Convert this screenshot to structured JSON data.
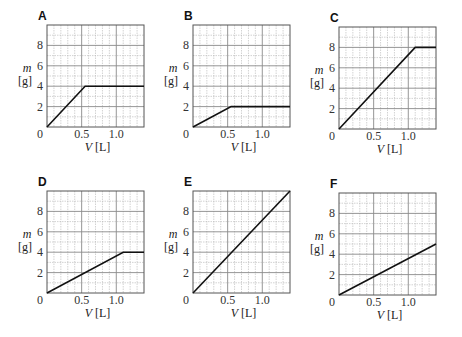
{
  "chart_data": [
    {
      "type": "line",
      "panel": "A",
      "xlabel_var": "V",
      "xlabel_unit": "[L]",
      "ylabel_var": "m",
      "ylabel_unit": "[g]",
      "xlim": [
        0,
        1.4
      ],
      "ylim": [
        0,
        10
      ],
      "xticks": [
        0.5,
        1.0
      ],
      "xtick_labels": [
        "0.5",
        "1.0"
      ],
      "yticks": [
        2,
        4,
        6,
        8
      ],
      "ytick_labels": [
        "2",
        "4",
        "6",
        "8"
      ],
      "origin_label": "0",
      "grid": true,
      "series": [
        {
          "name": "m vs V",
          "x": [
            0,
            0.55,
            1.4
          ],
          "y": [
            0,
            4,
            4
          ]
        }
      ]
    },
    {
      "type": "line",
      "panel": "B",
      "xlabel_var": "V",
      "xlabel_unit": "[L]",
      "ylabel_var": "m",
      "ylabel_unit": "[g]",
      "xlim": [
        0,
        1.4
      ],
      "ylim": [
        0,
        10
      ],
      "xticks": [
        0.5,
        1.0
      ],
      "xtick_labels": [
        "0.5",
        "1.0"
      ],
      "yticks": [
        2,
        4,
        6,
        8
      ],
      "ytick_labels": [
        "2",
        "4",
        "6",
        "8"
      ],
      "origin_label": "0",
      "grid": true,
      "series": [
        {
          "name": "m vs V",
          "x": [
            0,
            0.55,
            1.4
          ],
          "y": [
            0,
            2,
            2
          ]
        }
      ]
    },
    {
      "type": "line",
      "panel": "C",
      "xlabel_var": "V",
      "xlabel_unit": "[L]",
      "ylabel_var": "m",
      "ylabel_unit": "[g]",
      "xlim": [
        0,
        1.4
      ],
      "ylim": [
        0,
        10
      ],
      "xticks": [
        0.5,
        1.0
      ],
      "xtick_labels": [
        "0.5",
        "1.0"
      ],
      "yticks": [
        2,
        4,
        6,
        8
      ],
      "ytick_labels": [
        "2",
        "4",
        "6",
        "8"
      ],
      "origin_label": "0",
      "grid": true,
      "series": [
        {
          "name": "m vs V",
          "x": [
            0,
            1.1,
            1.4
          ],
          "y": [
            0,
            8,
            8
          ]
        }
      ]
    },
    {
      "type": "line",
      "panel": "D",
      "xlabel_var": "V",
      "xlabel_unit": "[L]",
      "ylabel_var": "m",
      "ylabel_unit": "[g]",
      "xlim": [
        0,
        1.4
      ],
      "ylim": [
        0,
        10
      ],
      "xticks": [
        0.5,
        1.0
      ],
      "xtick_labels": [
        "0.5",
        "1.0"
      ],
      "yticks": [
        2,
        4,
        6,
        8
      ],
      "ytick_labels": [
        "2",
        "4",
        "6",
        "8"
      ],
      "origin_label": "0",
      "grid": true,
      "series": [
        {
          "name": "m vs V",
          "x": [
            0,
            1.1,
            1.4
          ],
          "y": [
            0,
            4,
            4
          ]
        }
      ]
    },
    {
      "type": "line",
      "panel": "E",
      "xlabel_var": "V",
      "xlabel_unit": "[L]",
      "ylabel_var": "m",
      "ylabel_unit": "[g]",
      "xlim": [
        0,
        1.4
      ],
      "ylim": [
        0,
        10
      ],
      "xticks": [
        0.5,
        1.0
      ],
      "xtick_labels": [
        "0.5",
        "1.0"
      ],
      "yticks": [
        2,
        4,
        6,
        8
      ],
      "ytick_labels": [
        "2",
        "4",
        "6",
        "8"
      ],
      "origin_label": "0",
      "grid": true,
      "series": [
        {
          "name": "m vs V",
          "x": [
            0,
            1.4
          ],
          "y": [
            0,
            10
          ]
        }
      ]
    },
    {
      "type": "line",
      "panel": "F",
      "xlabel_var": "V",
      "xlabel_unit": "[L]",
      "ylabel_var": "m",
      "ylabel_unit": "[g]",
      "xlim": [
        0,
        1.4
      ],
      "ylim": [
        0,
        10
      ],
      "xticks": [
        0.5,
        1.0
      ],
      "xtick_labels": [
        "0.5",
        "1.0"
      ],
      "yticks": [
        2,
        4,
        6,
        8
      ],
      "ytick_labels": [
        "2",
        "4",
        "6",
        "8"
      ],
      "origin_label": "0",
      "grid": true,
      "series": [
        {
          "name": "m vs V",
          "x": [
            0,
            1.4
          ],
          "y": [
            0,
            5
          ]
        }
      ]
    }
  ],
  "style": {
    "line_color": "#111111",
    "frame_color": "#555555",
    "grid_major_color": "#8a8a8a",
    "grid_minor_color": "#b5b5b5",
    "text_color": "#333333"
  }
}
